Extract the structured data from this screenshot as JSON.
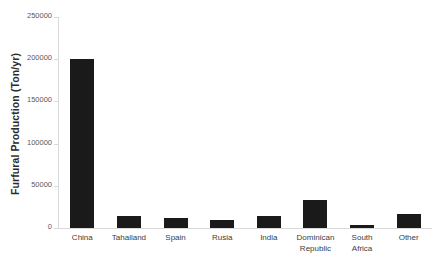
{
  "chart_data": {
    "type": "bar",
    "title": "",
    "subtitle": "",
    "xlabel": "",
    "ylabel": "Furfural Production (Ton/yr)",
    "categories": [
      "China",
      "Tahailand",
      "Spain",
      "Rusia",
      "India",
      "Dominican\nRepublic",
      "South\nAfrica",
      "Other"
    ],
    "values": [
      200000,
      14000,
      12000,
      9000,
      14000,
      33000,
      3000,
      17000
    ],
    "ylim": [
      0,
      250000
    ],
    "ytick_labels": [
      "0",
      "50000",
      "100000",
      "150000",
      "200000",
      "250000"
    ],
    "ytick_values": [
      0,
      50000,
      100000,
      150000,
      200000,
      250000
    ],
    "grid": false,
    "legend": false,
    "legend_position": "none",
    "bar_color": "#1a1a1a",
    "axis_color": "#d9d9d9",
    "background_color": "#ffffff"
  }
}
